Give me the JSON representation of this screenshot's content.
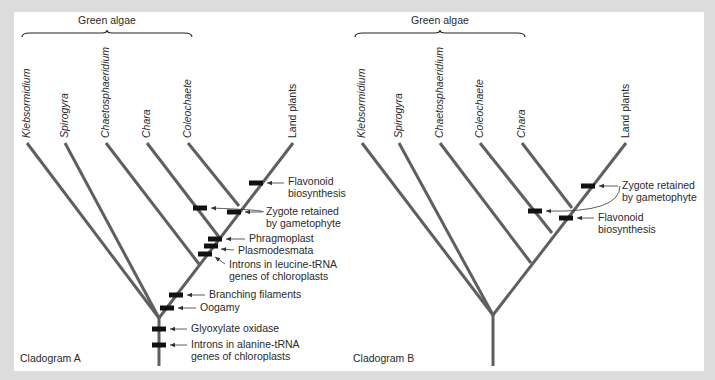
{
  "colors": {
    "background": "#dcdcdc",
    "panel": "#ffffff",
    "branch": "#5f5f5f",
    "character_mark": "#111111",
    "text": "#2a2a2a"
  },
  "cladograms": [
    {
      "id": "A",
      "label": "Cladogram A",
      "label_pos": [
        20,
        362
      ],
      "group_label": "Green algae",
      "group_label_pos": [
        107,
        24
      ],
      "brace": {
        "x1": 22,
        "x2": 192,
        "peak": 107,
        "y": 33
      },
      "root": {
        "x": 159,
        "y_top": 318,
        "y_bottom": 366
      },
      "taxa": [
        {
          "name": "Klebsormidium",
          "tip": [
            27,
            143
          ],
          "join": [
            159,
            318
          ]
        },
        {
          "name": "Spirogyra",
          "tip": [
            65,
            143
          ],
          "join": [
            159,
            318
          ]
        },
        {
          "name": "Chaetosphaeridium",
          "tip": [
            106,
            143
          ],
          "join": [
            199,
            264
          ]
        },
        {
          "name": "Chara",
          "tip": [
            147,
            143
          ],
          "join": [
            219,
            237
          ]
        },
        {
          "name": "Coleochaete",
          "tip": [
            188,
            143
          ],
          "join": [
            239,
            206
          ]
        },
        {
          "name": "Land plants",
          "tip": [
            293,
            143
          ],
          "join": null
        }
      ],
      "spine": {
        "from": [
          159,
          318
        ],
        "to": [
          293,
          143
        ]
      },
      "characters": [
        {
          "label": [
            "Flavonoid",
            "biosynthesis"
          ],
          "mark": [
            256,
            183
          ],
          "text_pos": [
            288,
            185
          ],
          "arrow": "straight"
        },
        {
          "label": [
            "Zygote retained",
            "by gametophyte"
          ],
          "mark": [
            234,
            212
          ],
          "text_pos": [
            266,
            215
          ],
          "arrow": "straight",
          "extra_mark": [
            200,
            208
          ]
        },
        {
          "label": [
            "Phragmoplast"
          ],
          "mark": [
            215,
            239
          ],
          "text_pos": [
            249,
            242
          ],
          "arrow": "straight"
        },
        {
          "label": [
            "Plasmodesmata"
          ],
          "mark": [
            211,
            246
          ],
          "text_pos": [
            238,
            254
          ],
          "arrow": "diag"
        },
        {
          "label": [
            "Introns in leucine-tRNA",
            "genes of chloroplasts"
          ],
          "mark": [
            205,
            254
          ],
          "text_pos": [
            229,
            268
          ],
          "arrow": "diag"
        },
        {
          "label": [
            "Branching filaments"
          ],
          "mark": [
            176,
            295
          ],
          "text_pos": [
            209,
            298
          ],
          "arrow": "straight"
        },
        {
          "label": [
            "Oogamy"
          ],
          "mark": [
            167,
            308
          ],
          "text_pos": [
            200,
            311
          ],
          "arrow": "straight"
        },
        {
          "label": [
            "Glyoxylate oxidase"
          ],
          "mark": [
            159,
            329
          ],
          "text_pos": [
            191,
            332
          ],
          "arrow": "straight"
        },
        {
          "label": [
            "Introns in alanine-tRNA",
            "genes of chloroplasts"
          ],
          "mark": [
            159,
            345
          ],
          "text_pos": [
            191,
            348
          ],
          "arrow": "straight"
        }
      ]
    },
    {
      "id": "B",
      "label": "Cladogram B",
      "label_pos": [
        353,
        362
      ],
      "group_label": "Green algae",
      "group_label_pos": [
        440,
        24
      ],
      "brace": {
        "x1": 355,
        "x2": 525,
        "peak": 440,
        "y": 33
      },
      "root": {
        "x": 493,
        "y_top": 315,
        "y_bottom": 366
      },
      "taxa": [
        {
          "name": "Klebsormidium",
          "tip": [
            362,
            143
          ],
          "join": [
            493,
            315
          ]
        },
        {
          "name": "Spirogyra",
          "tip": [
            399,
            143
          ],
          "join": [
            493,
            315
          ]
        },
        {
          "name": "Chaetosphaeridium",
          "tip": [
            440,
            143
          ],
          "join": [
            531,
            263
          ]
        },
        {
          "name": "Coleochaete",
          "tip": [
            480,
            143
          ],
          "join": [
            552,
            233
          ]
        },
        {
          "name": "Chara",
          "tip": [
            522,
            143
          ],
          "join": [
            572,
            208
          ]
        },
        {
          "name": "Land plants",
          "tip": [
            626,
            143
          ],
          "join": null
        }
      ],
      "spine": {
        "from": [
          493,
          315
        ],
        "to": [
          626,
          143
        ]
      },
      "characters": [
        {
          "label": [
            "Zygote retained",
            "by gametophyte"
          ],
          "mark": [
            588,
            186
          ],
          "text_pos": [
            622,
            189
          ],
          "arrow": "straight",
          "extra_mark": [
            535,
            211
          ]
        },
        {
          "label": [
            "Flavonoid",
            "biosynthesis"
          ],
          "mark": [
            566,
            218
          ],
          "text_pos": [
            598,
            221
          ],
          "arrow": "straight"
        }
      ]
    }
  ]
}
